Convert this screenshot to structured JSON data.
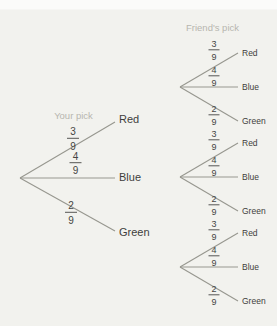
{
  "diagram": {
    "headings": {
      "your_pick": "Your pick",
      "friends_pick": "Friend's pick"
    },
    "outcomes": [
      {
        "label": "Red",
        "probability": {
          "numerator": "3",
          "denominator": "9"
        }
      },
      {
        "label": "Blue",
        "probability": {
          "numerator": "4",
          "denominator": "9"
        }
      },
      {
        "label": "Green",
        "probability": {
          "numerator": "2",
          "denominator": "9"
        }
      }
    ],
    "colors": {
      "page_background": "#fbfbfa",
      "panel_background": "#f2f2ee",
      "branch_line": "#97978f",
      "outcome_text": "#3e3e3c",
      "fraction_text": "#454543",
      "heading_text": "#b7b6af"
    }
  }
}
